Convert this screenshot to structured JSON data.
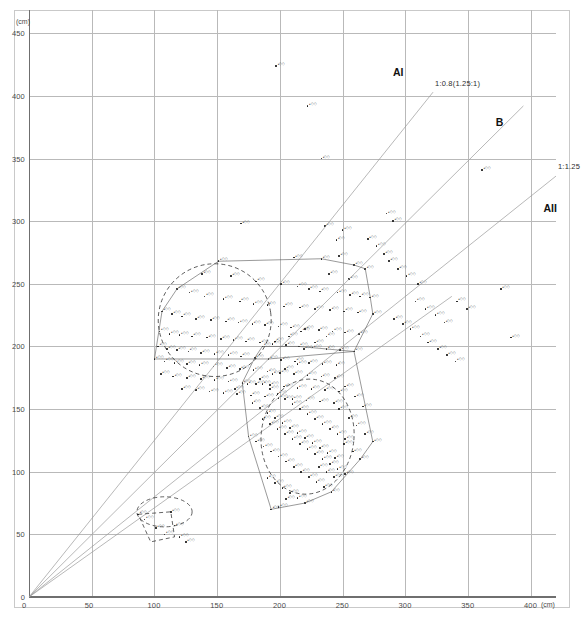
{
  "chart_data": {
    "type": "scatter",
    "title": "",
    "subtitle": "",
    "xlabel": "(cm)",
    "ylabel": "(cm)",
    "xlim": [
      0,
      420
    ],
    "ylim": [
      0,
      455
    ],
    "grid": true,
    "legend_position": "in-plot-annotations",
    "xticks": [
      0,
      50,
      100,
      150,
      200,
      250,
      300,
      350,
      400
    ],
    "xticklabels": [
      "0",
      "50",
      "100",
      "150",
      "200",
      "250",
      "300",
      "350",
      "400"
    ],
    "x_unit_label": "(cm)",
    "yticks": [
      0,
      50,
      100,
      150,
      200,
      250,
      300,
      350,
      400,
      450
    ],
    "yticklabels": [
      "0",
      "50",
      "100",
      "150",
      "200",
      "250",
      "300",
      "350",
      "400",
      "450"
    ],
    "y_unit_label": "(cm)",
    "reference_lines": [
      {
        "name": "line-a1",
        "label": "1:0.8(1.25:1)",
        "label_x": 322,
        "label_y": 404,
        "slope": 1.25,
        "x_end": 322,
        "y_end": 403
      },
      {
        "name": "line-b",
        "label": "",
        "label_x": 0,
        "label_y": 0,
        "slope": 0.995,
        "x_end": 394,
        "y_end": 392
      },
      {
        "name": "line-a2",
        "label": "1:1.25",
        "label_x": 420,
        "label_y": 338,
        "slope": 0.8,
        "x_end": 420,
        "y_end": 336
      },
      {
        "name": "line-extra",
        "label": "",
        "label_x": 0,
        "label_y": 0,
        "slope": 0.712,
        "x_end": 337,
        "y_end": 240
      }
    ],
    "group_labels": [
      {
        "name": "group-a1",
        "text": "AI",
        "x": 290,
        "y": 418
      },
      {
        "name": "group-b",
        "text": "B",
        "x": 372,
        "y": 378
      },
      {
        "name": "group-a2",
        "text": "AII",
        "x": 410,
        "y": 310
      }
    ],
    "clusters": [
      {
        "name": "cluster-left",
        "outline": "dashed-ellipse",
        "cx": 148,
        "cy": 221,
        "rx": 45,
        "ry": 45,
        "rotation": -8
      },
      {
        "name": "cluster-right",
        "outline": "dashed-ellipse",
        "cx": 222,
        "cy": 128,
        "rx": 37,
        "ry": 46,
        "rotation": 6
      },
      {
        "name": "cluster-lower-left",
        "outline": "dashed-polygon",
        "cx": 108,
        "cy": 68,
        "rx": 22,
        "ry": 12,
        "rotation": 0
      }
    ],
    "series": [
      {
        "name": "samples",
        "marker": "dot",
        "color": "#111111",
        "points": [
          [
            197,
            424
          ],
          [
            222,
            392
          ],
          [
            233,
            350
          ],
          [
            361,
            341
          ],
          [
            285,
            306
          ],
          [
            169,
            298
          ],
          [
            290,
            300
          ],
          [
            236,
            296
          ],
          [
            250,
            293
          ],
          [
            245,
            285
          ],
          [
            233,
            270
          ],
          [
            247,
            272
          ],
          [
            376,
            246
          ],
          [
            259,
            265
          ],
          [
            268,
            262
          ],
          [
            211,
            271
          ],
          [
            239,
            258
          ],
          [
            255,
            254
          ],
          [
            151,
            268
          ],
          [
            138,
            258
          ],
          [
            161,
            256
          ],
          [
            181,
            252
          ],
          [
            201,
            250
          ],
          [
            214,
            248
          ],
          [
            223,
            246
          ],
          [
            232,
            244
          ],
          [
            246,
            243
          ],
          [
            256,
            241
          ],
          [
            264,
            240
          ],
          [
            272,
            239
          ],
          [
            118,
            246
          ],
          [
            128,
            243
          ],
          [
            140,
            240
          ],
          [
            155,
            238
          ],
          [
            168,
            236
          ],
          [
            179,
            234
          ],
          [
            190,
            233
          ],
          [
            203,
            232
          ],
          [
            216,
            231
          ],
          [
            228,
            230
          ],
          [
            240,
            229
          ],
          [
            251,
            228
          ],
          [
            262,
            227
          ],
          [
            274,
            226
          ],
          [
            106,
            228
          ],
          [
            114,
            226
          ],
          [
            122,
            224
          ],
          [
            133,
            222
          ],
          [
            145,
            221
          ],
          [
            157,
            220
          ],
          [
            167,
            219
          ],
          [
            178,
            218
          ],
          [
            188,
            217
          ],
          [
            199,
            216
          ],
          [
            209,
            215
          ],
          [
            220,
            214
          ],
          [
            231,
            213
          ],
          [
            242,
            212
          ],
          [
            252,
            211
          ],
          [
            263,
            210
          ],
          [
            104,
            212
          ],
          [
            112,
            210
          ],
          [
            120,
            209
          ],
          [
            130,
            208
          ],
          [
            142,
            207
          ],
          [
            153,
            206
          ],
          [
            163,
            205
          ],
          [
            173,
            204
          ],
          [
            184,
            203
          ],
          [
            194,
            202
          ],
          [
            205,
            201
          ],
          [
            215,
            200
          ],
          [
            226,
            199
          ],
          [
            237,
            198
          ],
          [
            248,
            197
          ],
          [
            259,
            196
          ],
          [
            103,
            200
          ],
          [
            110,
            198
          ],
          [
            118,
            197
          ],
          [
            127,
            196
          ],
          [
            137,
            195
          ],
          [
            148,
            194
          ],
          [
            159,
            193
          ],
          [
            169,
            192
          ],
          [
            180,
            191
          ],
          [
            191,
            190
          ],
          [
            201,
            189
          ],
          [
            212,
            188
          ],
          [
            223,
            187
          ],
          [
            234,
            186
          ],
          [
            245,
            185
          ],
          [
            100,
            190
          ],
          [
            108,
            188
          ],
          [
            116,
            187
          ],
          [
            126,
            186
          ],
          [
            136,
            185
          ],
          [
            147,
            184
          ],
          [
            158,
            183
          ],
          [
            168,
            182
          ],
          [
            179,
            181
          ],
          [
            190,
            180
          ],
          [
            200,
            179
          ],
          [
            211,
            178
          ],
          [
            222,
            177
          ],
          [
            233,
            176
          ],
          [
            244,
            175
          ],
          [
            105,
            178
          ],
          [
            115,
            176
          ],
          [
            126,
            175
          ],
          [
            137,
            174
          ],
          [
            148,
            173
          ],
          [
            159,
            172
          ],
          [
            170,
            171
          ],
          [
            181,
            170
          ],
          [
            192,
            169
          ],
          [
            203,
            168
          ],
          [
            214,
            167
          ],
          [
            225,
            166
          ],
          [
            236,
            165
          ],
          [
            247,
            164
          ],
          [
            122,
            166
          ],
          [
            133,
            165
          ],
          [
            144,
            164
          ],
          [
            155,
            163
          ],
          [
            166,
            162
          ],
          [
            177,
            161
          ],
          [
            188,
            160
          ],
          [
            199,
            159
          ],
          [
            210,
            158
          ],
          [
            221,
            157
          ],
          [
            232,
            156
          ],
          [
            243,
            155
          ],
          [
            186,
            170
          ],
          [
            192,
            166
          ],
          [
            198,
            162
          ],
          [
            204,
            158
          ],
          [
            210,
            154
          ],
          [
            216,
            150
          ],
          [
            222,
            146
          ],
          [
            228,
            142
          ],
          [
            234,
            138
          ],
          [
            240,
            134
          ],
          [
            246,
            130
          ],
          [
            252,
            126
          ],
          [
            178,
            155
          ],
          [
            184,
            151
          ],
          [
            190,
            147
          ],
          [
            196,
            143
          ],
          [
            202,
            139
          ],
          [
            208,
            135
          ],
          [
            214,
            131
          ],
          [
            220,
            127
          ],
          [
            226,
            123
          ],
          [
            232,
            119
          ],
          [
            238,
            115
          ],
          [
            244,
            111
          ],
          [
            186,
            142
          ],
          [
            192,
            138
          ],
          [
            198,
            134
          ],
          [
            204,
            130
          ],
          [
            210,
            126
          ],
          [
            216,
            122
          ],
          [
            222,
            118
          ],
          [
            228,
            114
          ],
          [
            234,
            110
          ],
          [
            240,
            106
          ],
          [
            246,
            102
          ],
          [
            252,
            98
          ],
          [
            175,
            128
          ],
          [
            181,
            124
          ],
          [
            187,
            120
          ],
          [
            193,
            116
          ],
          [
            199,
            112
          ],
          [
            205,
            108
          ],
          [
            211,
            104
          ],
          [
            217,
            100
          ],
          [
            223,
            96
          ],
          [
            229,
            92
          ],
          [
            235,
            88
          ],
          [
            241,
            84
          ],
          [
            190,
            95
          ],
          [
            196,
            91
          ],
          [
            202,
            87
          ],
          [
            208,
            83
          ],
          [
            214,
            79
          ],
          [
            220,
            75
          ],
          [
            199,
            72
          ],
          [
            205,
            78
          ],
          [
            193,
            70
          ],
          [
            247,
            150
          ],
          [
            255,
            143
          ],
          [
            261,
            137
          ],
          [
            268,
            130
          ],
          [
            274,
            124
          ],
          [
            251,
            122
          ],
          [
            258,
            116
          ],
          [
            264,
            110
          ],
          [
            252,
            168
          ],
          [
            260,
            160
          ],
          [
            266,
            152
          ],
          [
            243,
            96
          ],
          [
            237,
            100
          ],
          [
            231,
            104
          ],
          [
            186,
            200
          ],
          [
            196,
            204
          ],
          [
            207,
            208
          ],
          [
            217,
            212
          ],
          [
            291,
            222
          ],
          [
            298,
            218
          ],
          [
            304,
            214
          ],
          [
            312,
            208
          ],
          [
            318,
            203
          ],
          [
            326,
            198
          ],
          [
            333,
            193
          ],
          [
            340,
            188
          ],
          [
            308,
            236
          ],
          [
            316,
            230
          ],
          [
            324,
            225
          ],
          [
            331,
            219
          ],
          [
            341,
            236
          ],
          [
            349,
            230
          ],
          [
            287,
            268
          ],
          [
            294,
            262
          ],
          [
            301,
            256
          ],
          [
            310,
            250
          ],
          [
            270,
            286
          ],
          [
            277,
            280
          ],
          [
            283,
            274
          ],
          [
            87,
            66
          ],
          [
            92,
            62
          ],
          [
            113,
            68
          ],
          [
            116,
            57
          ],
          [
            120,
            48
          ],
          [
            125,
            44
          ],
          [
            101,
            55
          ],
          [
            108,
            50
          ],
          [
            237,
            208
          ],
          [
            228,
            203
          ],
          [
            219,
            198
          ],
          [
            384,
            207
          ],
          [
            214,
            186
          ],
          [
            204,
            182
          ],
          [
            194,
            178
          ],
          [
            184,
            174
          ],
          [
            174,
            170
          ],
          [
            164,
            166
          ]
        ]
      }
    ]
  },
  "annotations": {
    "note": ""
  }
}
